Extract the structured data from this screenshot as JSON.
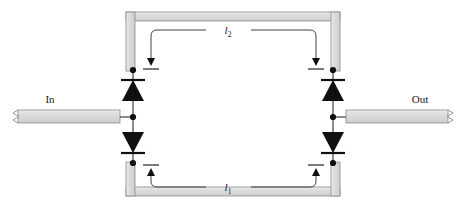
{
  "figure": {
    "background_color": "#ffffff"
  },
  "labels": {
    "input_port": "In",
    "output_port": "Out",
    "arm_upper": "l",
    "arm_upper_sub": "2",
    "arm_lower": "l",
    "arm_lower_sub": "1"
  },
  "colors": {
    "waveguide_fill": "#d6d6d6",
    "waveguide_stroke": "#8a8a8a",
    "wire": "#3a3a3a",
    "diode_fill": "#101010",
    "text": "#1a1a1a",
    "arrow": "#101010"
  },
  "geometry": {
    "ring_outer_left": 126,
    "ring_outer_right": 340,
    "ring_outer_top": 12,
    "ring_outer_bottom": 196,
    "ring_bar_thickness": 9,
    "node_left_x": 133,
    "node_right_x": 333,
    "node_top_y": 70,
    "node_bottom_y": 163,
    "node_mid_y": 117,
    "in_bar_x": 6,
    "in_bar_w": 114,
    "out_bar_x": 346,
    "out_bar_w": 114,
    "bar_y": 110,
    "bar_h": 14
  },
  "components": {
    "diodes": [
      {
        "name": "diode-top-left",
        "orientation": "up",
        "cx": 133,
        "cy": 92
      },
      {
        "name": "diode-bottom-left",
        "orientation": "down",
        "cx": 133,
        "cy": 142
      },
      {
        "name": "diode-top-right",
        "orientation": "up",
        "cx": 333,
        "cy": 92
      },
      {
        "name": "diode-bottom-right",
        "orientation": "down",
        "cx": 333,
        "cy": 142
      }
    ],
    "junction_dots": [
      {
        "name": "junction-top-left",
        "cx": 133,
        "cy": 70
      },
      {
        "name": "junction-mid-left",
        "cx": 133,
        "cy": 117
      },
      {
        "name": "junction-bottom-left",
        "cx": 133,
        "cy": 163
      },
      {
        "name": "junction-top-right",
        "cx": 333,
        "cy": 70
      },
      {
        "name": "junction-mid-right",
        "cx": 333,
        "cy": 117
      },
      {
        "name": "junction-bottom-right",
        "cx": 333,
        "cy": 163
      }
    ],
    "dimension_arrows": [
      {
        "name": "arrow-upper-left",
        "direction": "down",
        "x": 151,
        "y": 68
      },
      {
        "name": "arrow-upper-right",
        "direction": "down",
        "x": 316,
        "y": 68
      },
      {
        "name": "arrow-lower-left",
        "direction": "up",
        "x": 151,
        "y": 166
      },
      {
        "name": "arrow-lower-right",
        "direction": "up",
        "x": 316,
        "y": 166
      }
    ]
  }
}
